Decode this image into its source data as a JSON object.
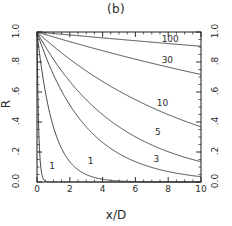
{
  "figure": {
    "title": "(b)",
    "background": "#ffffff",
    "line_color": "#333333",
    "axis_color": "#1a1a1a"
  },
  "chart_data": {
    "type": "line",
    "title": "(b)",
    "xlabel": "x/D",
    "ylabel": "R",
    "xlim": [
      0,
      10
    ],
    "ylim": [
      0,
      1.0
    ],
    "grid": false,
    "legend": "inline-curve-labels",
    "xticks": [
      0,
      2,
      4,
      6,
      8,
      10
    ],
    "xticklabels": [
      "0",
      "2",
      "4",
      "6",
      "8",
      "10"
    ],
    "xminor_step": 0.5,
    "yticks": [
      0.0,
      0.2,
      0.4,
      0.6,
      0.8,
      1.0
    ],
    "yticklabels_left": [
      "0.0",
      ".2",
      ".4",
      ".6",
      ".8",
      "1.0"
    ],
    "yticklabels_right": [
      "0.0",
      ".2",
      ".4",
      ".6",
      ".8",
      "1.0"
    ],
    "yminor_step": 0.05,
    "right_axis_mirrored": true,
    "x": [
      0,
      0.25,
      0.5,
      0.75,
      1,
      1.5,
      2,
      2.5,
      3,
      3.5,
      4,
      4.5,
      5,
      5.5,
      6,
      6.5,
      7,
      7.5,
      8,
      8.5,
      9,
      9.5,
      10
    ],
    "series": [
      {
        "name": "0.1",
        "label": "1",
        "label_x": 0.75,
        "label_y": 0.1,
        "decay": 0.1,
        "values": [
          1.0,
          0.082,
          0.0067,
          0.0006,
          0.0,
          0.0,
          0.0,
          0.0,
          0.0,
          0.0,
          0.0,
          0.0,
          0.0,
          0.0,
          0.0,
          0.0,
          0.0,
          0.0,
          0.0,
          0.0,
          0.0,
          0.0,
          0.0
        ]
      },
      {
        "name": "1",
        "label": "1",
        "label_x": 3.1,
        "label_y": 0.135,
        "decay": 1,
        "values": [
          1.0,
          0.779,
          0.607,
          0.472,
          0.368,
          0.223,
          0.135,
          0.082,
          0.05,
          0.03,
          0.018,
          0.011,
          0.0067,
          0.0041,
          0.0025,
          0.0015,
          0.0009,
          0.0006,
          0.0003,
          0.0002,
          0.0001,
          0.0001,
          0.0
        ]
      },
      {
        "name": "3",
        "label": "3",
        "label_x": 7.1,
        "label_y": 0.15,
        "decay": 3,
        "values": [
          1.0,
          0.92,
          0.846,
          0.779,
          0.717,
          0.607,
          0.513,
          0.435,
          0.368,
          0.311,
          0.264,
          0.223,
          0.189,
          0.16,
          0.135,
          0.115,
          0.097,
          0.082,
          0.069,
          0.059,
          0.05,
          0.042,
          0.036
        ]
      },
      {
        "name": "5",
        "label": "5",
        "label_x": 7.2,
        "label_y": 0.33,
        "decay": 5,
        "values": [
          1.0,
          0.951,
          0.905,
          0.861,
          0.819,
          0.741,
          0.67,
          0.607,
          0.549,
          0.497,
          0.449,
          0.407,
          0.368,
          0.333,
          0.301,
          0.273,
          0.247,
          0.223,
          0.202,
          0.183,
          0.165,
          0.15,
          0.135
        ]
      },
      {
        "name": "10",
        "label": "10",
        "label_x": 7.3,
        "label_y": 0.52,
        "decay": 10,
        "values": [
          1.0,
          0.975,
          0.951,
          0.928,
          0.905,
          0.861,
          0.819,
          0.779,
          0.741,
          0.705,
          0.67,
          0.638,
          0.607,
          0.577,
          0.549,
          0.522,
          0.497,
          0.472,
          0.449,
          0.427,
          0.407,
          0.387,
          0.368
        ]
      },
      {
        "name": "30",
        "label": "30",
        "label_x": 7.6,
        "label_y": 0.81,
        "decay": 30,
        "values": [
          1.0,
          0.992,
          0.983,
          0.975,
          0.967,
          0.951,
          0.936,
          0.92,
          0.905,
          0.89,
          0.875,
          0.861,
          0.846,
          0.833,
          0.819,
          0.805,
          0.792,
          0.779,
          0.766,
          0.754,
          0.741,
          0.729,
          0.717
        ]
      },
      {
        "name": "100",
        "label": "100",
        "label_x": 7.6,
        "label_y": 0.945,
        "decay": 100,
        "values": [
          1.0,
          0.998,
          0.995,
          0.993,
          0.99,
          0.985,
          0.98,
          0.975,
          0.97,
          0.966,
          0.961,
          0.956,
          0.951,
          0.946,
          0.942,
          0.937,
          0.932,
          0.928,
          0.923,
          0.919,
          0.914,
          0.91,
          0.905
        ]
      }
    ]
  }
}
